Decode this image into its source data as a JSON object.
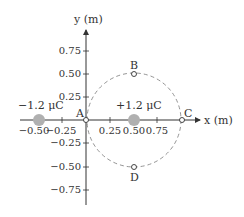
{
  "axes": {
    "x_label": "x (m)",
    "y_label": "y (m)",
    "x_ticks": [
      "−0.50",
      "−0.25",
      "0.25",
      "0.50",
      "0.75"
    ],
    "y_ticks": [
      "0.75",
      "0.50",
      "0.25",
      "−0.25",
      "−0.50",
      "−0.75"
    ]
  },
  "charges": [
    {
      "label": "−1.2 μC",
      "x": -0.5,
      "y": 0
    },
    {
      "label": "+1.2 μC",
      "x": 0.5,
      "y": 0
    }
  ],
  "points": [
    {
      "label": "A",
      "x": 0,
      "y": 0
    },
    {
      "label": "B",
      "x": 0.5,
      "y": 0.5
    },
    {
      "label": "C",
      "x": 1.0,
      "y": 0
    },
    {
      "label": "D",
      "x": 0.5,
      "y": -0.5
    }
  ],
  "circle": {
    "center_x": 0.5,
    "center_y": 0,
    "radius": 0.5,
    "style": "dashed"
  },
  "colors": {
    "axis": "#333333",
    "charge": "#b0b0b0",
    "circle": "#888888"
  }
}
